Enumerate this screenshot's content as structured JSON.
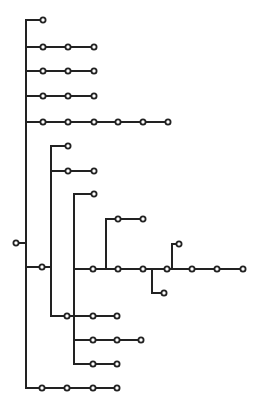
{
  "diagram": {
    "type": "tree",
    "colors": {
      "line": "#222222",
      "node_fill": "#ffffff",
      "background": "#ffffff"
    },
    "node_radius": 2.6,
    "root": {
      "x": 16,
      "y": 243
    },
    "edges": [
      [
        16,
        243,
        26,
        243
      ],
      [
        26,
        20,
        26,
        388
      ],
      [
        26,
        20,
        43,
        20
      ],
      [
        26,
        47,
        94,
        47
      ],
      [
        26,
        71,
        94,
        71
      ],
      [
        26,
        96,
        94,
        96
      ],
      [
        26,
        122,
        168,
        122
      ],
      [
        26,
        267,
        51,
        267
      ],
      [
        51,
        146,
        51,
        316
      ],
      [
        51,
        146,
        68,
        146
      ],
      [
        51,
        171,
        94,
        171
      ],
      [
        51,
        316,
        117,
        316
      ],
      [
        74,
        194,
        74,
        364
      ],
      [
        74,
        194,
        94,
        194
      ],
      [
        74,
        269,
        243,
        269
      ],
      [
        74,
        340,
        141,
        340
      ],
      [
        74,
        364,
        117,
        364
      ],
      [
        106,
        219,
        106,
        269
      ],
      [
        106,
        219,
        143,
        219
      ],
      [
        152,
        269,
        152,
        293
      ],
      [
        152,
        293,
        164,
        293
      ],
      [
        172,
        244,
        172,
        269
      ],
      [
        172,
        244,
        179,
        244
      ],
      [
        26,
        388,
        117,
        388
      ]
    ],
    "nodes": [
      [
        16,
        243
      ],
      [
        43,
        20
      ],
      [
        43,
        47
      ],
      [
        68,
        47
      ],
      [
        94,
        47
      ],
      [
        43,
        71
      ],
      [
        68,
        71
      ],
      [
        94,
        71
      ],
      [
        43,
        96
      ],
      [
        68,
        96
      ],
      [
        94,
        96
      ],
      [
        43,
        122
      ],
      [
        68,
        122
      ],
      [
        94,
        122
      ],
      [
        118,
        122
      ],
      [
        143,
        122
      ],
      [
        168,
        122
      ],
      [
        42,
        267
      ],
      [
        68,
        146
      ],
      [
        68,
        171
      ],
      [
        94,
        171
      ],
      [
        94,
        194
      ],
      [
        118,
        219
      ],
      [
        143,
        219
      ],
      [
        93,
        269
      ],
      [
        118,
        269
      ],
      [
        143,
        269
      ],
      [
        167,
        269
      ],
      [
        192,
        269
      ],
      [
        217,
        269
      ],
      [
        243,
        269
      ],
      [
        164,
        293
      ],
      [
        179,
        244
      ],
      [
        67,
        316
      ],
      [
        93,
        316
      ],
      [
        117,
        316
      ],
      [
        93,
        340
      ],
      [
        117,
        340
      ],
      [
        141,
        340
      ],
      [
        93,
        364
      ],
      [
        117,
        364
      ],
      [
        42,
        388
      ],
      [
        67,
        388
      ],
      [
        93,
        388
      ],
      [
        117,
        388
      ]
    ]
  }
}
